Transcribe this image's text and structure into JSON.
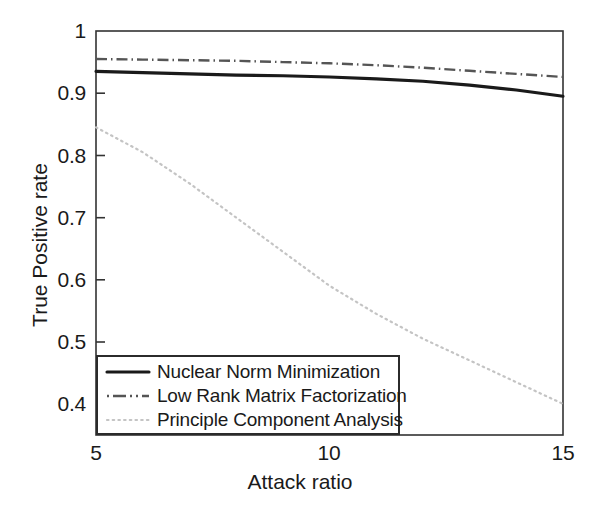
{
  "chart_data": {
    "type": "line",
    "title": "",
    "xlabel": "Attack ratio",
    "ylabel": "True Positive rate",
    "xlim": [
      5,
      15
    ],
    "ylim": [
      0.35,
      1.0
    ],
    "xticks": [
      "5",
      "10",
      "15"
    ],
    "xtick_values": [
      5,
      10,
      15
    ],
    "yticks": [
      "0.4",
      "0.5",
      "0.6",
      "0.7",
      "0.8",
      "0.9",
      "1"
    ],
    "ytick_values": [
      0.4,
      0.5,
      0.6,
      0.7,
      0.8,
      0.9,
      1.0
    ],
    "grid": false,
    "legend_position": "lower left",
    "x": [
      5,
      6,
      7,
      8,
      9,
      10,
      11,
      12,
      13,
      14,
      15
    ],
    "series": [
      {
        "name": "Nuclear Norm Minimization",
        "style": "solid",
        "color": "#1a1a1a",
        "values": [
          0.935,
          0.933,
          0.931,
          0.929,
          0.928,
          0.926,
          0.923,
          0.919,
          0.913,
          0.905,
          0.895
        ]
      },
      {
        "name": "Low Rank Matrix Factorization",
        "style": "dash-dot",
        "color": "#555555",
        "values": [
          0.955,
          0.954,
          0.953,
          0.952,
          0.95,
          0.948,
          0.945,
          0.941,
          0.936,
          0.931,
          0.926
        ]
      },
      {
        "name": "Principle Component Analysis",
        "style": "dotted",
        "color": "#bbbbbb",
        "values": [
          0.845,
          0.805,
          0.755,
          0.7,
          0.645,
          0.59,
          0.545,
          0.505,
          0.47,
          0.435,
          0.4
        ]
      }
    ]
  },
  "legend": {
    "items": [
      {
        "label": "Nuclear Norm Minimization",
        "style": "solid"
      },
      {
        "label": "Low Rank Matrix Factorization",
        "style": "dash-dot"
      },
      {
        "label": "Principle Component Analysis",
        "style": "dotted"
      }
    ]
  },
  "axes": {
    "y_label": "True Positive rate",
    "x_label": "Attack ratio",
    "ytick_0": "1",
    "ytick_1": "0.9",
    "ytick_2": "0.8",
    "ytick_3": "0.7",
    "ytick_4": "0.6",
    "ytick_5": "0.5",
    "ytick_6": "0.4",
    "xtick_0": "5",
    "xtick_1": "10",
    "xtick_2": "15"
  }
}
